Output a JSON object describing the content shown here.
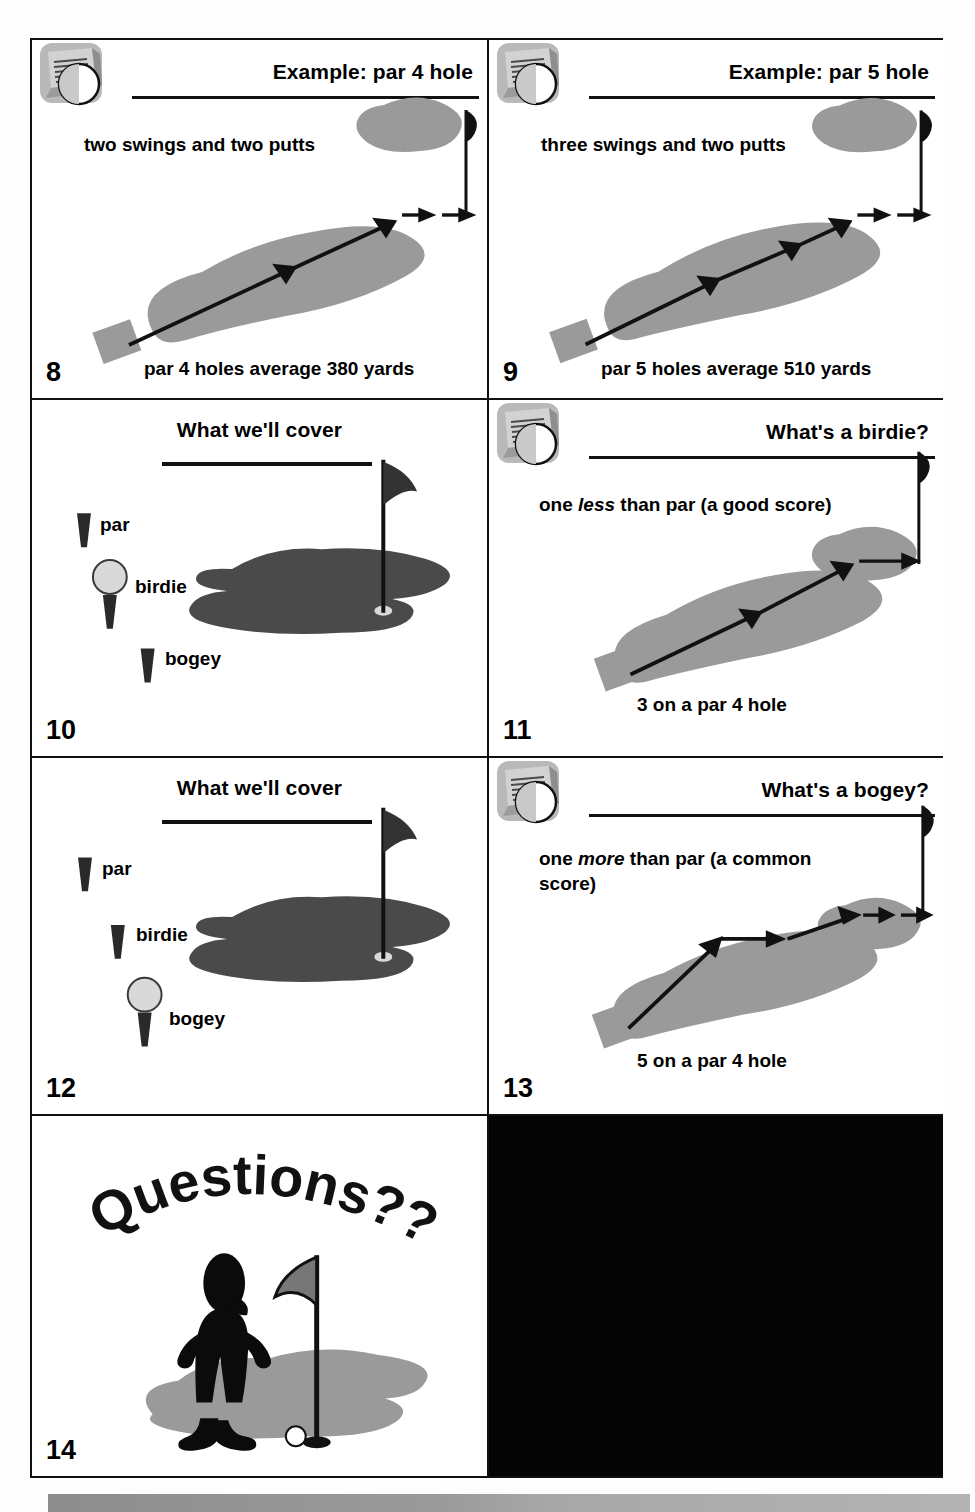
{
  "document": {
    "kind": "scanned-handout-page",
    "columns": 2,
    "rows": 4,
    "ink_black": "#111111",
    "fairway_gray": "#9a9a9a",
    "green_dark": "#4a4a4a",
    "paper_white": "#ffffff",
    "dark_panel_color": "#050505",
    "footer_strip": "gray-gradient-bar"
  },
  "slides": [
    {
      "number": "8",
      "header_title": "Example: par 4 hole",
      "header_icon": "computer-monitor-icon",
      "header_align": "right",
      "body_text": "two swings and two putts",
      "footer_text": "par 4 holes average 380 yards",
      "graphic": "golf-hole-fairway-with-strokes",
      "strokes": 4,
      "swings": 2,
      "putts": 2
    },
    {
      "number": "9",
      "header_title": "Example: par 5 hole",
      "header_icon": "computer-monitor-icon",
      "header_align": "right",
      "body_text": "three swings and two putts",
      "footer_text": "par 5 holes average 510 yards",
      "graphic": "golf-hole-fairway-with-strokes",
      "strokes": 5,
      "swings": 3,
      "putts": 2
    },
    {
      "number": "10",
      "header_title": "What we'll cover",
      "header_icon": "none",
      "header_align": "center",
      "graphic": "putting-green-with-flag",
      "legend": [
        {
          "label": "par",
          "marker": "tee"
        },
        {
          "label": "birdie",
          "marker": "ball-on-tee"
        },
        {
          "label": "bogey",
          "marker": "tee"
        }
      ],
      "highlighted_item": "birdie"
    },
    {
      "number": "11",
      "header_title": "What's a birdie?",
      "header_icon": "computer-monitor-icon",
      "header_align": "right",
      "body_text_parts": [
        {
          "text": "one ",
          "style": "normal"
        },
        {
          "text": "less",
          "style": "italic"
        },
        {
          "text": " than par (a good score)",
          "style": "normal"
        }
      ],
      "body_text": "one less than par (a good score)",
      "footer_text": "3 on a par 4 hole",
      "graphic": "golf-hole-fairway-with-strokes",
      "strokes": 3
    },
    {
      "number": "12",
      "header_title": "What we'll cover",
      "header_icon": "none",
      "header_align": "center",
      "graphic": "putting-green-with-flag",
      "legend": [
        {
          "label": "par",
          "marker": "tee"
        },
        {
          "label": "birdie",
          "marker": "tee"
        },
        {
          "label": "bogey",
          "marker": "ball-on-tee"
        }
      ],
      "highlighted_item": "bogey"
    },
    {
      "number": "13",
      "header_title": "What's a bogey?",
      "header_icon": "computer-monitor-icon",
      "header_align": "right",
      "body_text_parts": [
        {
          "text": "one ",
          "style": "normal"
        },
        {
          "text": "more",
          "style": "italic"
        },
        {
          "text": " than par (a common score)",
          "style": "normal"
        }
      ],
      "body_text": "one more than par (a common score)",
      "footer_text": "5 on a par 4 hole",
      "graphic": "golf-hole-fairway-with-strokes",
      "strokes": 5
    },
    {
      "number": "14",
      "header_title": "",
      "header_icon": "none",
      "curved_title": "Questions??",
      "graphic": "golfer-standing-by-flag-on-green"
    }
  ],
  "dark_panel": {
    "label": "blank-dark-scan-region",
    "content": ""
  }
}
